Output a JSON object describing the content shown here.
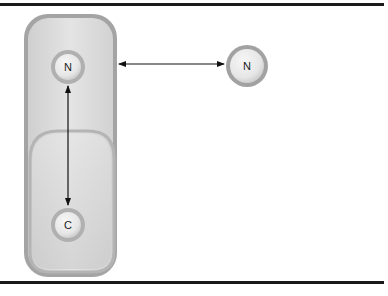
{
  "diagram": {
    "type": "molecular-interaction-schematic",
    "nodes": [
      {
        "id": "n_top",
        "label": "N",
        "group": "molecule",
        "position": "top-of-molecule"
      },
      {
        "id": "c_bottom",
        "label": "C",
        "group": "molecule",
        "position": "bottom-of-molecule"
      },
      {
        "id": "n_free",
        "label": "N",
        "group": "free",
        "position": "right-free"
      }
    ],
    "edges": [
      {
        "from": "n_top",
        "to": "c_bottom",
        "style": "double-arrow",
        "orientation": "vertical"
      },
      {
        "from": "molecule",
        "to": "n_free",
        "style": "double-arrow",
        "orientation": "horizontal"
      }
    ],
    "colors": {
      "rule": "#1a1a1a",
      "pill_outer": "#9e9e9e",
      "pill_fill": "#d6d6d6",
      "circle_ring": "#a8a8a8",
      "circle_fill": "#eeeeee",
      "arrow": "#111111"
    }
  }
}
